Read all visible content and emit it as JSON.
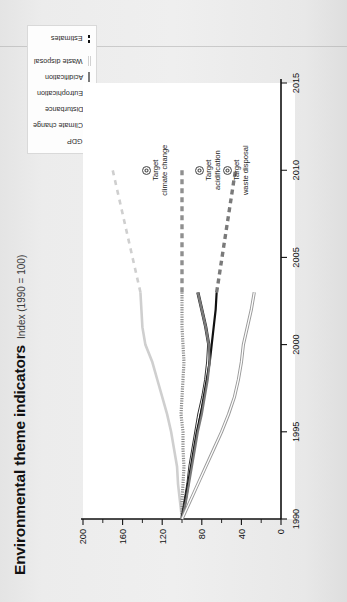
{
  "title": {
    "main": "Environmental theme indicators",
    "sub": "Index (1990 = 100)"
  },
  "legend": {
    "items": [
      {
        "label": "GDP",
        "color": "#cfcfcf",
        "style": "solid"
      },
      {
        "label": "Climate change",
        "color": "#8f8f8f",
        "style": "dotted"
      },
      {
        "label": "Disturbance",
        "color": "#5c5c5c",
        "style": "double"
      },
      {
        "label": "Eutrophication",
        "color": "#111111",
        "style": "solid"
      },
      {
        "label": "Acidification",
        "color": "#7a7a7a",
        "style": "solid"
      },
      {
        "label": "Waste disposal",
        "color": "#d2d2d2",
        "style": "double"
      },
      {
        "label": "Estimates",
        "color": "#111111",
        "style": "dashed"
      }
    ]
  },
  "annotations": [
    {
      "id": "target-climate-change",
      "line1": "Target",
      "line2": "climate change"
    },
    {
      "id": "target-acidification",
      "line1": "Target",
      "line2": "acidification"
    },
    {
      "id": "target-waste-disposal",
      "line1": "Target",
      "line2": "waste disposal"
    }
  ],
  "chart_data": {
    "type": "line",
    "title": "Environmental theme indicators",
    "subtitle": "Index (1990 = 100)",
    "xlabel": "",
    "ylabel": "Index (1990 = 100)",
    "xlim": [
      1990,
      2015
    ],
    "ylim": [
      0,
      200
    ],
    "xticks": [
      1990,
      1995,
      2000,
      2005,
      2010,
      2015
    ],
    "yticks": [
      0,
      40,
      80,
      120,
      160,
      200
    ],
    "yticks_minor": [
      20,
      60,
      100,
      140,
      180
    ],
    "grid": false,
    "legend_position": "top-right",
    "x": [
      1990,
      1991,
      1992,
      1993,
      1994,
      1995,
      1996,
      1997,
      1998,
      1999,
      2000,
      2001,
      2002,
      2003
    ],
    "series": [
      {
        "name": "GDP",
        "color": "#cfcfcf",
        "values": [
          100,
          102,
          104,
          105,
          108,
          111,
          115,
          120,
          125,
          130,
          137,
          140,
          141,
          142
        ],
        "estimate_x": [
          2003,
          2010
        ],
        "estimate_values": [
          142,
          170
        ]
      },
      {
        "name": "Climate change",
        "color": "#8f8f8f",
        "values": [
          100,
          100,
          99,
          98,
          99,
          99,
          101,
          100,
          99,
          98,
          99,
          100,
          100,
          100
        ],
        "estimate_x": [
          2003,
          2010
        ],
        "estimate_values": [
          100,
          100
        ]
      },
      {
        "name": "Disturbance",
        "color": "#5c5c5c",
        "values": [
          100,
          97,
          94,
          92,
          89,
          86,
          83,
          79,
          76,
          74,
          73,
          76,
          80,
          84
        ],
        "estimate_x": [],
        "estimate_values": []
      },
      {
        "name": "Eutrophication",
        "color": "#111111",
        "values": [
          100,
          97,
          94,
          91,
          88,
          85,
          81,
          78,
          75,
          72,
          70,
          68,
          66,
          65
        ],
        "estimate_x": [],
        "estimate_values": []
      },
      {
        "name": "Acidification",
        "color": "#7a7a7a",
        "values": [
          100,
          96,
          93,
          90,
          87,
          84,
          80,
          77,
          74,
          72,
          73,
          76,
          80,
          84
        ],
        "estimate_x": [
          2003,
          2010
        ],
        "estimate_values": [
          65,
          46
        ]
      },
      {
        "name": "Waste disposal",
        "color": "#d2d2d2",
        "values": [
          100,
          92,
          84,
          76,
          68,
          60,
          53,
          47,
          43,
          40,
          38,
          34,
          30,
          27
        ],
        "estimate_x": [],
        "estimate_values": []
      }
    ],
    "targets": [
      {
        "name": "Target climate change",
        "x": 2010,
        "y": 100
      },
      {
        "name": "Target acidification",
        "x": 2010,
        "y": 46
      },
      {
        "name": "Target waste disposal",
        "x": 2010,
        "y": 18
      }
    ]
  }
}
